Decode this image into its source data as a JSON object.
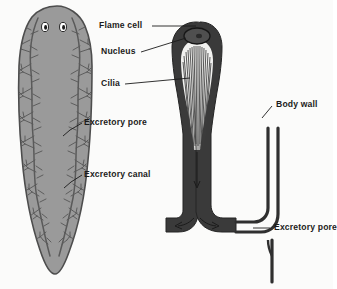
{
  "figure": {
    "background_color": "#fbfbfa",
    "ink_color": "#1b1b1b",
    "body_fill": "#9a9a9a",
    "body_outline": "#4a4a4a",
    "canal_color": "#5a5a5a",
    "flamecell_fill": "#3a3a3a"
  },
  "labels": {
    "flame_cell": "Flame cell",
    "nucleus": "Nucleus",
    "cilia": "Cilia",
    "body_wall": "Body wall",
    "excretory_pore_right": "Excretory pore",
    "excretory_pore_left": "Excretory pore",
    "excretory_canal": "Excretory canal"
  },
  "left_panel": {
    "name": "planarian-whole-body",
    "features": [
      "eyespot-left",
      "eyespot-right",
      "excretory-canal-left",
      "excretory-canal-right"
    ]
  },
  "right_panel": {
    "name": "flame-cell-detail",
    "parts": [
      "flame-cell-cap",
      "nucleus-oval",
      "cilia-tuft",
      "collecting-tubule",
      "body-wall",
      "excretory-pore"
    ],
    "flow_arrows": [
      "down-arrow-in-tubule",
      "left-arrow-at-pore",
      "right-arrow-at-pore"
    ]
  }
}
